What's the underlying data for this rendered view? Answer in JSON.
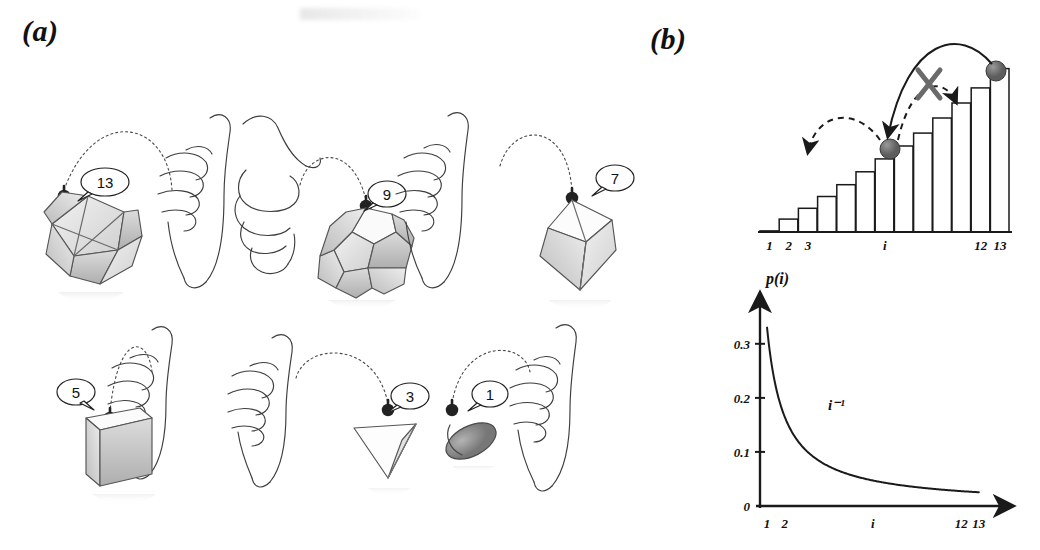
{
  "figure": {
    "panels": [
      {
        "id": "a",
        "label": "(a)"
      },
      {
        "id": "b",
        "label": "(b)"
      }
    ]
  },
  "panel_a": {
    "label": "(a)",
    "caption_items": [
      {
        "shape": "icosahedron",
        "faces": "13",
        "bubble": "13",
        "row": 1,
        "order": 1
      },
      {
        "shape": "dodecahedron",
        "faces": "9",
        "bubble": "9",
        "row": 1,
        "order": 2
      },
      {
        "shape": "octahedron",
        "faces": "7",
        "bubble": "7",
        "row": 1,
        "order": 3
      },
      {
        "shape": "cube",
        "faces": "5",
        "bubble": "5",
        "row": 2,
        "order": 1
      },
      {
        "shape": "tetrahedron",
        "faces": "3",
        "bubble": "3",
        "row": 2,
        "order": 2
      },
      {
        "shape": "coin",
        "faces": "1",
        "bubble": "1",
        "row": 2,
        "order": 3
      }
    ],
    "hand_count": 6,
    "arrow_style": "dashed-arc",
    "colors": {
      "ink": "#3a3a3a",
      "shade_light": "#e8e8e8",
      "shade_mid": "#c9c9c9",
      "shade_dark": "#a8a8a8"
    }
  },
  "panel_b": {
    "label": "(b)",
    "annotations": {
      "forbidden_mark": "X",
      "ball_current": "ball on bar i",
      "ball_top": "ball on bar 13"
    }
  },
  "chart_data": [
    {
      "type": "bar",
      "title": "",
      "xlabel": "",
      "ylabel": "",
      "categories": [
        "1",
        "2",
        "3",
        "4",
        "5",
        "6",
        "i",
        "8",
        "9",
        "10",
        "11",
        "12",
        "13"
      ],
      "tick_labels": [
        "1",
        "2",
        "3",
        "i",
        "12",
        "13"
      ],
      "tick_label_positions": [
        1,
        2,
        3,
        7,
        12,
        13
      ],
      "values": [
        1,
        12,
        22,
        33,
        44,
        56,
        68,
        80,
        92,
        106,
        120,
        134,
        152
      ],
      "ylim": [
        0,
        160
      ],
      "grid": false,
      "legend": null,
      "markers": [
        {
          "name": "ball-at-i",
          "category": "i",
          "index": 7
        },
        {
          "name": "ball-at-13",
          "category": "13",
          "index": 13
        }
      ],
      "arrows": [
        {
          "name": "solid-arrow-down-from-13-to-i",
          "style": "solid",
          "from": "13",
          "to": "i"
        },
        {
          "name": "dashed-arrow-blocked-up",
          "style": "dashed",
          "from": "i",
          "to": "11",
          "blocked": true
        },
        {
          "name": "dashed-arrow-escape-left",
          "style": "dashed",
          "from": "i",
          "to": "outside-left",
          "blocked": false
        }
      ]
    },
    {
      "type": "line",
      "title": "",
      "ylabel": "p(i)",
      "xlabel": "",
      "annotation": "i-1",
      "annotation_display": "i⁻¹",
      "x": [
        1,
        2,
        3,
        4,
        5,
        6,
        7,
        8,
        9,
        10,
        11,
        12,
        13
      ],
      "y": [
        0.33,
        0.165,
        0.11,
        0.0825,
        0.066,
        0.055,
        0.0471,
        0.0413,
        0.0367,
        0.033,
        0.03,
        0.0275,
        0.0254
      ],
      "ytick_labels": [
        "0",
        "0.1",
        "0.2",
        "0.3"
      ],
      "ytick_values": [
        0,
        0.1,
        0.2,
        0.3
      ],
      "xtick_labels": [
        "1",
        "2",
        "i",
        "12",
        "13"
      ],
      "xtick_values": [
        1,
        2,
        7,
        12,
        13
      ],
      "ylim": [
        0,
        0.37
      ],
      "xlim": [
        0.6,
        14.2
      ],
      "grid": false,
      "legend": null
    }
  ]
}
